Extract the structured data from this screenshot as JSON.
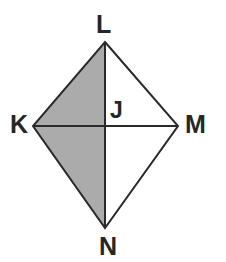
{
  "figure": {
    "shape_type": "kite",
    "background_color": "#ffffff",
    "stroke_color": "#2a2a2a",
    "stroke_width": 2,
    "shaded_fill_color": "#ababab",
    "unshaded_fill_color": "#ffffff",
    "vertices": {
      "L": {
        "label": "L",
        "x": 105,
        "y": 42
      },
      "K": {
        "label": "K",
        "x": 33,
        "y": 126
      },
      "M": {
        "label": "M",
        "x": 178,
        "y": 126
      },
      "N": {
        "label": "N",
        "x": 105,
        "y": 228
      },
      "J": {
        "label": "J",
        "x": 105,
        "y": 126
      }
    },
    "outline_points": "105,42 178,126 105,228 33,126",
    "shaded_region_points": "105,42 105,228 33,126",
    "diagonals": [
      {
        "name": "vertical-diagonal-LN",
        "x1": 105,
        "y1": 42,
        "x2": 105,
        "y2": 228
      },
      {
        "name": "horizontal-diagonal-KM",
        "x1": 33,
        "y1": 126,
        "x2": 178,
        "y2": 126
      }
    ],
    "regions": [
      {
        "name": "triangle-KLJ",
        "shaded": true
      },
      {
        "name": "triangle-KJN",
        "shaded": true
      },
      {
        "name": "triangle-LJM",
        "shaded": false
      },
      {
        "name": "triangle-JNM",
        "shaded": false
      }
    ]
  }
}
